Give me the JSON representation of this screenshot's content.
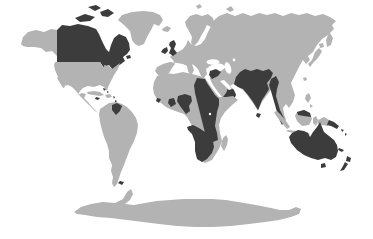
{
  "figure": {
    "alt": "World map with no text; oceans white, most land light grey, selected territories shaded dark grey",
    "colors": {
      "ocean": "#ffffff",
      "land": "#b3b3b3",
      "highlight": "#3c3c3c"
    },
    "regions": {
      "alaska": {
        "name": "Alaska",
        "shaded": false
      },
      "canada": {
        "name": "Canada",
        "shaded": true
      },
      "usa-mexico": {
        "name": "United States, Mexico & Central America",
        "shaded": false
      },
      "greenland": {
        "name": "Greenland",
        "shaded": false
      },
      "iceland": {
        "name": "Iceland",
        "shaded": false
      },
      "cuba": {
        "name": "Cuba",
        "shaded": false
      },
      "hispaniola": {
        "name": "Hispaniola",
        "shaded": false
      },
      "jamaica": {
        "name": "Jamaica",
        "shaded": true
      },
      "bahamas": {
        "name": "Bahamas",
        "shaded": true
      },
      "antilles": {
        "name": "Lesser Antilles",
        "shaded": true
      },
      "south-america": {
        "name": "South America",
        "shaded": false
      },
      "guyana": {
        "name": "Guyana",
        "shaded": true
      },
      "falklands": {
        "name": "Falkland Islands",
        "shaded": true
      },
      "scandinavia": {
        "name": "Scandinavia",
        "shaded": false
      },
      "svalbard": {
        "name": "Svalbard",
        "shaded": false
      },
      "novaya-zemlya": {
        "name": "Novaya Zemlya",
        "shaded": false
      },
      "eurasia": {
        "name": "Eurasia mainland",
        "shaded": false
      },
      "uk": {
        "name": "Great Britain",
        "shaded": true
      },
      "ireland": {
        "name": "Ireland",
        "shaded": true
      },
      "levant": {
        "name": "Levant & Iraq",
        "shaded": true
      },
      "arabia-se": {
        "name": "Southern & Eastern Arabia",
        "shaded": true
      },
      "africa": {
        "name": "Africa mainland",
        "shaded": false
      },
      "egypt-east-africa": {
        "name": "Egypt, Sudan & East Africa",
        "shaded": true
      },
      "southern-africa": {
        "name": "Southern Africa",
        "shaded": true
      },
      "ghana": {
        "name": "Ghana",
        "shaded": true
      },
      "nigeria-cameroon": {
        "name": "Nigeria & Cameroon",
        "shaded": true
      },
      "sierra-leone": {
        "name": "Sierra Leone",
        "shaded": true
      },
      "madagascar": {
        "name": "Madagascar",
        "shaded": false
      },
      "india": {
        "name": "Pakistan, India & Bangladesh",
        "shaded": true
      },
      "myanmar-malaya": {
        "name": "Myanmar & Malaya",
        "shaded": true
      },
      "sri-lanka": {
        "name": "Sri Lanka",
        "shaded": true
      },
      "taiwan": {
        "name": "Taiwan",
        "shaded": false
      },
      "japan": {
        "name": "Japan",
        "shaded": false
      },
      "philippines": {
        "name": "Philippines",
        "shaded": false
      },
      "sumatra": {
        "name": "Sumatra",
        "shaded": false
      },
      "java": {
        "name": "Java",
        "shaded": false
      },
      "borneo": {
        "name": "Borneo",
        "shaded": false
      },
      "borneo-north": {
        "name": "North Borneo",
        "shaded": true
      },
      "sulawesi": {
        "name": "Sulawesi",
        "shaded": false
      },
      "new-guinea-west": {
        "name": "Western New Guinea",
        "shaded": false
      },
      "png": {
        "name": "Papua New Guinea",
        "shaded": true
      },
      "solomons": {
        "name": "Solomon Islands",
        "shaded": true
      },
      "melanesia": {
        "name": "Melanesian islands",
        "shaded": true
      },
      "australia": {
        "name": "Australia",
        "shaded": true
      },
      "tasmania": {
        "name": "Tasmania",
        "shaded": true
      },
      "new-zealand": {
        "name": "New Zealand",
        "shaded": true
      },
      "antarctica": {
        "name": "Antarctica",
        "shaded": false
      }
    },
    "water_bodies": [
      "Black Sea",
      "Caspian Sea",
      "Aral Sea",
      "Persian Gulf",
      "Lake Victoria",
      "Great Lakes"
    ]
  }
}
